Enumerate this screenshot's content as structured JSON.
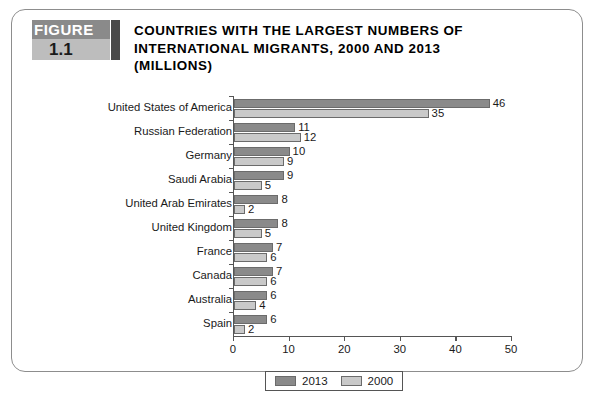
{
  "figure": {
    "badge_word": "FIGURE",
    "badge_number": "1.1",
    "title_lines": [
      "COUNTRIES WITH THE LARGEST NUMBERS OF",
      "INTERNATIONAL MIGRANTS, 2000 AND 2013",
      "(MILLIONS)"
    ]
  },
  "colors": {
    "series_2013": "#8a8a8a",
    "series_2000": "#c9c9c9",
    "badge_top": "#8a8a8a",
    "badge_bottom": "#bdbdbd",
    "badge_tab": "#4a4a4a",
    "axis": "#555555",
    "frame": "#8d8d8d"
  },
  "chart_data": {
    "type": "bar",
    "orientation": "horizontal",
    "title": "COUNTRIES WITH THE LARGEST NUMBERS OF INTERNATIONAL MIGRANTS, 2000 AND 2013 (MILLIONS)",
    "xlabel": "",
    "ylabel": "",
    "xlim": [
      0,
      50
    ],
    "xticks": [
      0,
      10,
      20,
      30,
      40,
      50
    ],
    "xtick_labels": [
      "0",
      "10",
      "20",
      "30",
      "40",
      "50"
    ],
    "grid": false,
    "legend_position": "bottom",
    "categories": [
      "United States of America",
      "Russian Federation",
      "Germany",
      "Saudi Arabia",
      "United Arab Emirates",
      "United Kingdom",
      "France",
      "Canada",
      "Australia",
      "Spain"
    ],
    "series": [
      {
        "name": "2013",
        "color": "#8a8a8a",
        "values": [
          46,
          11,
          10,
          9,
          8,
          8,
          7,
          7,
          6,
          6
        ],
        "labels": [
          "46",
          "11",
          "10",
          "9",
          "8",
          "8",
          "7",
          "7",
          "6",
          "6"
        ]
      },
      {
        "name": "2000",
        "color": "#c9c9c9",
        "values": [
          35,
          12,
          9,
          5,
          2,
          5,
          6,
          6,
          4,
          2
        ],
        "labels": [
          "35",
          "12",
          "9",
          "5",
          "2",
          "5",
          "6",
          "6",
          "4",
          "2"
        ]
      }
    ]
  }
}
